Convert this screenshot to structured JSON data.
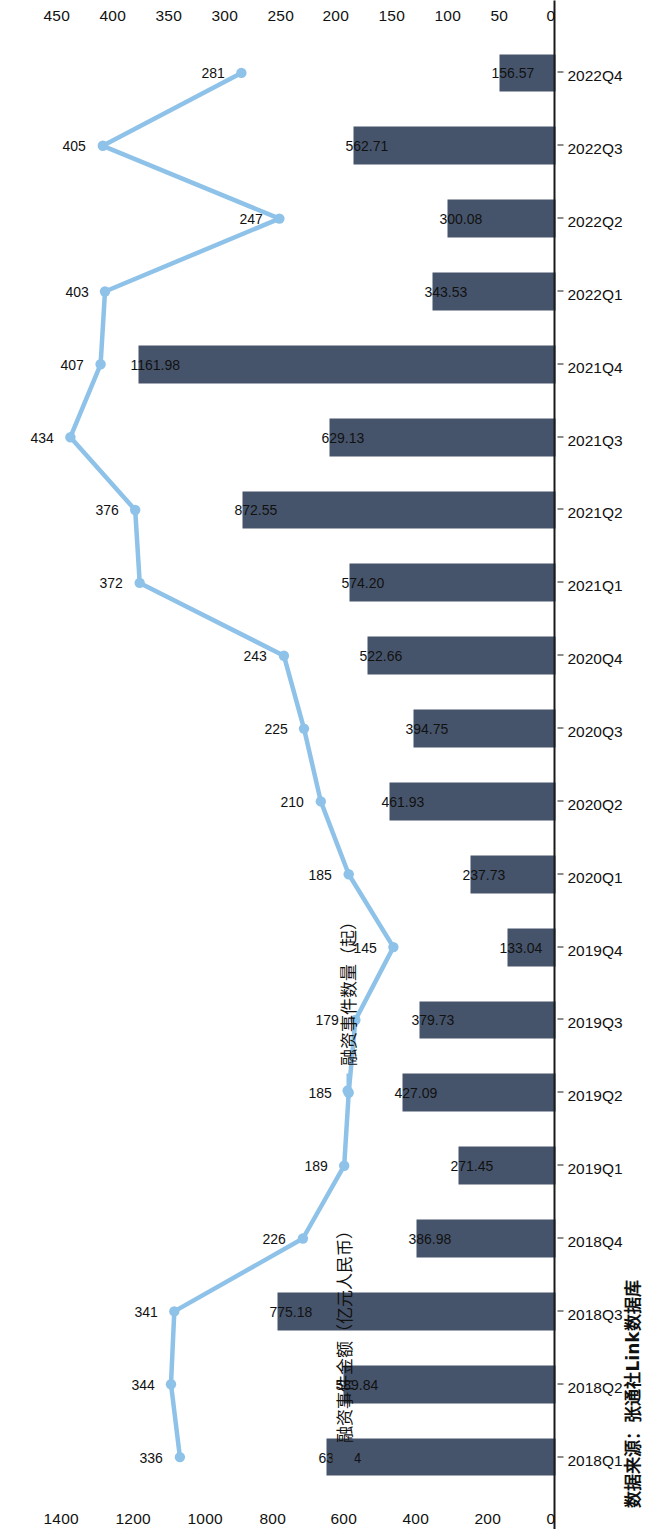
{
  "chart_data": {
    "type": "bar",
    "title": "",
    "subtitle": "",
    "xlabel": "",
    "categories": [
      "2018Q1",
      "2018Q2",
      "2018Q3",
      "2018Q4",
      "2019Q1",
      "2019Q2",
      "2019Q3",
      "2019Q4",
      "2020Q1",
      "2020Q2",
      "2020Q3",
      "2020Q4",
      "2021Q1",
      "2021Q2",
      "2021Q3",
      "2021Q4",
      "2022Q1",
      "2022Q2",
      "2022Q3",
      "2022Q4"
    ],
    "series": [
      {
        "name": "融资事件金额（亿元人民币）",
        "type": "bar",
        "color": "#46546b",
        "axis": "left",
        "ylabel": "融资事件金额（亿元人民币）",
        "ylim": [
          0,
          1400
        ],
        "yticks": [
          0,
          200,
          400,
          600,
          800,
          1000,
          1200,
          1400
        ],
        "values": [
          637.94,
          589.84,
          775.18,
          386.98,
          271.45,
          427.09,
          379.73,
          133.04,
          237.73,
          461.93,
          394.75,
          522.66,
          574.2,
          872.55,
          629.13,
          1161.98,
          343.53,
          300.08,
          562.71,
          156.57
        ],
        "labels": [
          "637.94",
          "589.84",
          "775.18",
          "386.98",
          "271.45",
          "427.09",
          "379.73",
          "133.04",
          "237.73",
          "461.93",
          "394.75",
          "522.66",
          "574.20",
          "872.55",
          "629.13",
          "1161.98",
          "343.53",
          "300.08",
          "562.71",
          "156.57"
        ]
      },
      {
        "name": "融资事件数量（起）",
        "type": "line",
        "color": "#8ec2e8",
        "axis": "right",
        "ylabel": "融资事件数量（起）",
        "ylim": [
          0,
          450
        ],
        "yticks": [
          0,
          50,
          100,
          150,
          200,
          250,
          300,
          350,
          400,
          450
        ],
        "values": [
          336,
          344,
          341,
          226,
          189,
          185,
          179,
          145,
          185,
          210,
          225,
          243,
          372,
          376,
          434,
          407,
          403,
          247,
          405,
          281
        ],
        "labels": [
          "336",
          "344",
          "341",
          "226",
          "189",
          "185",
          "179",
          "145",
          "185",
          "210",
          "225",
          "243",
          "372",
          "376",
          "434",
          "407",
          "403",
          "247",
          "405",
          "281"
        ]
      }
    ],
    "grid": "vertical",
    "legend_position": "left-middle"
  },
  "legend": {
    "bar_label": "融资事件金额（亿元人民币）",
    "line_label": "融资事件数量（起）"
  },
  "axes": {
    "left_ticks": [
      "0",
      "200",
      "400",
      "600",
      "800",
      "1000",
      "1200",
      "1400"
    ],
    "right_ticks": [
      "0",
      "50",
      "100",
      "150",
      "200",
      "250",
      "300",
      "350",
      "400",
      "450"
    ]
  },
  "footer": {
    "source": "数据来源：张通社Link数据库"
  },
  "colors": {
    "bar": "#46546b",
    "line": "#8ec2e8",
    "grid": "#e9e9e9",
    "axis": "#1a1a1a",
    "text": "#111111"
  }
}
